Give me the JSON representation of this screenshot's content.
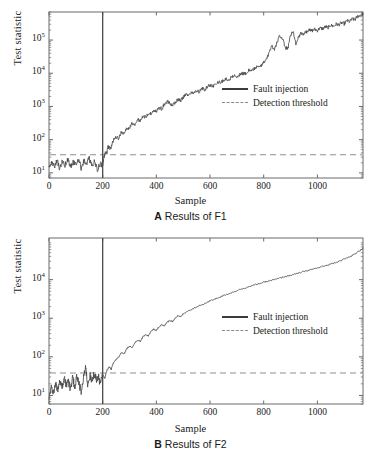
{
  "figure": {
    "title": "",
    "background": "#ffffff",
    "series_color": "#4a4a4a",
    "threshold_color": "#8f8f8f",
    "fault_line_color": "#4a4a4a",
    "axis_color": "#6b6b6b"
  },
  "panels": [
    {
      "id": "A",
      "caption_letter": "A",
      "caption_text": "Results of F1",
      "xlabel": "Sample",
      "ylabel": "Test statistic",
      "xticks": [
        "0",
        "200",
        "400",
        "600",
        "800",
        "1000"
      ],
      "yticks": [
        "10",
        "10",
        "10",
        "10",
        "10"
      ],
      "ytick_exponents": [
        "1",
        "2",
        "3",
        "4",
        "5"
      ],
      "legend": [
        {
          "label": "Fault injection",
          "style": "solid"
        },
        {
          "label": "Detection threshold",
          "style": "dashed"
        }
      ]
    },
    {
      "id": "B",
      "caption_letter": "B",
      "caption_text": "Results of F2",
      "xlabel": "Sample",
      "ylabel": "Test statistic",
      "xticks": [
        "0",
        "200",
        "400",
        "600",
        "800",
        "1000"
      ],
      "yticks": [
        "10",
        "10",
        "10",
        "10"
      ],
      "ytick_exponents": [
        "1",
        "2",
        "3",
        "4"
      ],
      "legend": [
        {
          "label": "Fault injection",
          "style": "solid"
        },
        {
          "label": "Detection threshold",
          "style": "dashed"
        }
      ]
    }
  ],
  "chart_data": [
    {
      "type": "line",
      "panel": "A",
      "title": "A Results of F1",
      "xlabel": "Sample",
      "ylabel": "Test statistic",
      "yscale": "log",
      "xlim": [
        0,
        1170
      ],
      "ylim": [
        7,
        700000
      ],
      "xticks": [
        0,
        200,
        400,
        600,
        800,
        1000
      ],
      "yticks": [
        10,
        100,
        1000,
        10000,
        100000
      ],
      "grid": false,
      "legend_position": "center-right",
      "annotations": {
        "fault_injection_sample": 200,
        "detection_threshold_value": 35
      },
      "series": [
        {
          "name": "Test statistic",
          "style": "solid",
          "color": "#4a4a4a",
          "x": [
            0,
            10,
            20,
            30,
            40,
            50,
            60,
            70,
            80,
            90,
            100,
            110,
            120,
            130,
            140,
            150,
            160,
            170,
            180,
            190,
            200,
            205,
            210,
            215,
            220,
            230,
            240,
            250,
            260,
            270,
            280,
            290,
            300,
            310,
            320,
            330,
            340,
            350,
            360,
            370,
            380,
            390,
            400,
            410,
            420,
            430,
            440,
            450,
            460,
            470,
            480,
            490,
            500,
            510,
            520,
            530,
            540,
            550,
            560,
            570,
            580,
            590,
            600,
            610,
            620,
            630,
            640,
            650,
            660,
            670,
            680,
            690,
            700,
            710,
            720,
            730,
            740,
            750,
            760,
            770,
            780,
            790,
            800,
            810,
            820,
            830,
            840,
            850,
            860,
            870,
            880,
            890,
            900,
            910,
            920,
            930,
            940,
            950,
            960,
            970,
            980,
            990,
            1000,
            1010,
            1020,
            1030,
            1040,
            1050,
            1060,
            1070,
            1080,
            1090,
            1100,
            1110,
            1120,
            1130,
            1140,
            1150,
            1160,
            1170
          ],
          "y": [
            14,
            20,
            16,
            24,
            13,
            22,
            17,
            26,
            15,
            21,
            18,
            25,
            14,
            23,
            19,
            27,
            16,
            22,
            12,
            18,
            17,
            30,
            45,
            38,
            60,
            55,
            95,
            120,
            110,
            175,
            150,
            230,
            215,
            310,
            280,
            400,
            360,
            520,
            470,
            640,
            600,
            780,
            700,
            930,
            860,
            1150,
            1400,
            1250,
            1050,
            1350,
            1600,
            1500,
            1900,
            2300,
            2100,
            2700,
            2500,
            3000,
            2800,
            3400,
            3200,
            3900,
            4300,
            4000,
            4900,
            5400,
            5100,
            6200,
            6800,
            6400,
            7600,
            8400,
            7900,
            9200,
            10000,
            9500,
            11500,
            13000,
            12000,
            15000,
            17000,
            16000,
            21000,
            26000,
            40000,
            70000,
            50000,
            90000,
            130000,
            110000,
            60000,
            55000,
            150000,
            170000,
            80000,
            130000,
            160000,
            150000,
            180000,
            200000,
            190000,
            210000,
            195000,
            230000,
            220000,
            250000,
            240000,
            280000,
            260000,
            300000,
            290000,
            330000,
            310000,
            380000,
            360000,
            430000,
            410000,
            520000,
            560000,
            620000
          ]
        },
        {
          "name": "Detection threshold",
          "style": "dashed",
          "color": "#8f8f8f",
          "constant_y": 35
        },
        {
          "name": "Fault injection",
          "style": "vertical",
          "color": "#4a4a4a",
          "constant_x": 200
        }
      ]
    },
    {
      "type": "line",
      "panel": "B",
      "title": "B Results of F2",
      "xlabel": "Sample",
      "ylabel": "Test statistic",
      "yscale": "log",
      "xlim": [
        0,
        1170
      ],
      "ylim": [
        6,
        120000
      ],
      "xticks": [
        0,
        200,
        400,
        600,
        800,
        1000
      ],
      "yticks": [
        10,
        100,
        1000,
        10000
      ],
      "grid": false,
      "legend_position": "center-right",
      "annotations": {
        "fault_injection_sample": 200,
        "detection_threshold_value": 38
      },
      "series": [
        {
          "name": "Test statistic",
          "style": "solid",
          "color": "#4a4a4a",
          "x": [
            0,
            8,
            16,
            24,
            32,
            40,
            48,
            56,
            64,
            72,
            80,
            88,
            96,
            104,
            112,
            120,
            128,
            136,
            144,
            152,
            160,
            168,
            176,
            184,
            192,
            200,
            208,
            216,
            224,
            232,
            240,
            250,
            260,
            270,
            280,
            290,
            300,
            310,
            320,
            330,
            340,
            350,
            360,
            370,
            380,
            390,
            400,
            410,
            420,
            430,
            440,
            450,
            460,
            470,
            480,
            490,
            500,
            520,
            540,
            560,
            580,
            600,
            620,
            640,
            660,
            680,
            700,
            720,
            740,
            760,
            780,
            800,
            820,
            840,
            860,
            880,
            900,
            920,
            940,
            960,
            980,
            1000,
            1020,
            1040,
            1060,
            1080,
            1100,
            1120,
            1140,
            1160,
            1170
          ],
          "y": [
            7,
            16,
            11,
            22,
            13,
            26,
            15,
            30,
            18,
            24,
            14,
            28,
            17,
            32,
            20,
            12,
            25,
            60,
            19,
            33,
            22,
            38,
            26,
            30,
            20,
            34,
            28,
            45,
            55,
            48,
            70,
            85,
            100,
            130,
            120,
            165,
            190,
            175,
            230,
            270,
            250,
            330,
            380,
            350,
            450,
            520,
            480,
            600,
            680,
            640,
            780,
            880,
            820,
            1000,
            1150,
            1080,
            1300,
            1550,
            1800,
            2100,
            2400,
            2800,
            3200,
            3600,
            4100,
            4600,
            5200,
            5800,
            6400,
            7100,
            7800,
            8500,
            9300,
            10000,
            11000,
            12000,
            13000,
            14000,
            15500,
            17000,
            18500,
            20000,
            22000,
            24000,
            27000,
            30000,
            34000,
            39000,
            46000,
            58000,
            66000
          ]
        },
        {
          "name": "Detection threshold",
          "style": "dashed",
          "color": "#8f8f8f",
          "constant_y": 38
        },
        {
          "name": "Fault injection",
          "style": "vertical",
          "color": "#4a4a4a",
          "constant_x": 200
        }
      ]
    }
  ]
}
